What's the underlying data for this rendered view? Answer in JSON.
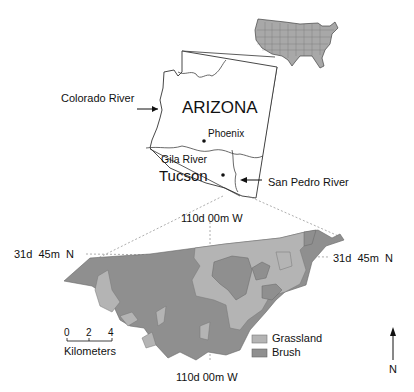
{
  "map": {
    "state_label": "ARIZONA",
    "inset_label": "USA",
    "colors": {
      "grassland": "#b4b4b4",
      "brush": "#8f8f8f",
      "us_fill": "#a8a8a8",
      "lines": "#333333"
    },
    "labels": {
      "colorado_river": "Colorado River",
      "phoenix": "Phoenix",
      "gila_river": "Gila River",
      "tucson": "Tucson",
      "san_pedro_river": "San Pedro River"
    },
    "coordinates": {
      "top_longitude": "110d 00m W",
      "bottom_longitude": "110d 00m W",
      "left_latitude": "31d  45m  N",
      "right_latitude": "31d  45m  N"
    },
    "scale_bar": {
      "ticks": [
        "0",
        "2",
        "4"
      ],
      "unit": "Kilometers"
    },
    "legend": [
      {
        "label": "Grassland",
        "color": "#b4b4b4"
      },
      {
        "label": "Brush",
        "color": "#8f8f8f"
      }
    ],
    "north_arrow": "N"
  }
}
